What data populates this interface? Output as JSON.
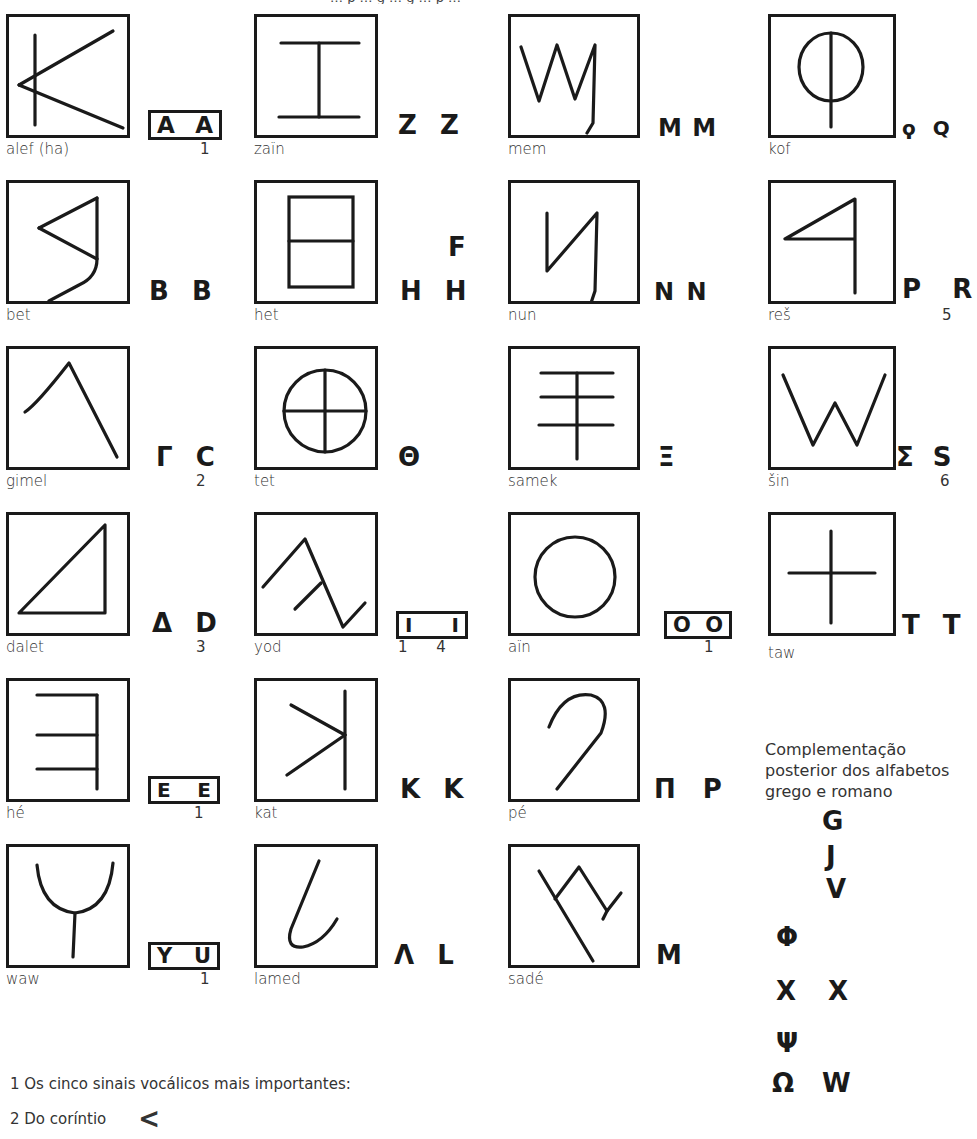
{
  "top_fragment": "… p … g … g … p …",
  "letters": [
    {
      "id": "alef",
      "name": "alef (ha)",
      "glyph": "alef-icon",
      "derivatives": [
        "A",
        "A"
      ],
      "vowel_box": true,
      "note": "1"
    },
    {
      "id": "bet",
      "name": "bet",
      "glyph": "bet-icon",
      "derivatives": [
        "B",
        "B"
      ],
      "vowel_box": false,
      "note": ""
    },
    {
      "id": "gimel",
      "name": "gimel",
      "glyph": "gimel-icon",
      "derivatives": [
        "Γ",
        "C"
      ],
      "vowel_box": false,
      "note": "2"
    },
    {
      "id": "dalet",
      "name": "dalet",
      "glyph": "dalet-icon",
      "derivatives": [
        "Δ",
        "D"
      ],
      "vowel_box": false,
      "note": "3"
    },
    {
      "id": "he",
      "name": "hé",
      "glyph": "he-icon",
      "derivatives": [
        "E",
        "E"
      ],
      "vowel_box": true,
      "note": "1"
    },
    {
      "id": "waw",
      "name": "waw",
      "glyph": "waw-icon",
      "derivatives": [
        "Y",
        "U"
      ],
      "vowel_box": true,
      "note": "1"
    },
    {
      "id": "zain",
      "name": "zaïn",
      "glyph": "zain-icon",
      "derivatives": [
        "Z",
        "Z"
      ],
      "vowel_box": false,
      "note": ""
    },
    {
      "id": "het",
      "name": "het",
      "glyph": "het-icon",
      "derivatives": [
        "H",
        "H"
      ],
      "extra": "F",
      "vowel_box": false,
      "note": ""
    },
    {
      "id": "tet",
      "name": "tet",
      "glyph": "tet-icon",
      "derivatives": [
        "Θ"
      ],
      "vowel_box": false,
      "note": ""
    },
    {
      "id": "yod",
      "name": "yod",
      "glyph": "yod-icon",
      "derivatives": [
        "I",
        "I"
      ],
      "vowel_box": true,
      "note": "1      4"
    },
    {
      "id": "kat",
      "name": "kat",
      "glyph": "kat-icon",
      "derivatives": [
        "K",
        "K"
      ],
      "vowel_box": false,
      "note": ""
    },
    {
      "id": "lamed",
      "name": "lamed",
      "glyph": "lamed-icon",
      "derivatives": [
        "Λ",
        "L"
      ],
      "vowel_box": false,
      "note": ""
    },
    {
      "id": "mem",
      "name": "mem",
      "glyph": "mem-icon",
      "derivatives": [
        "M",
        "M"
      ],
      "vowel_box": false,
      "note": ""
    },
    {
      "id": "nun",
      "name": "nun",
      "glyph": "nun-icon",
      "derivatives": [
        "N",
        "N"
      ],
      "vowel_box": false,
      "note": ""
    },
    {
      "id": "samek",
      "name": "samek",
      "glyph": "samek-icon",
      "derivatives": [
        "Ξ"
      ],
      "vowel_box": false,
      "note": ""
    },
    {
      "id": "ain",
      "name": "aïn",
      "glyph": "ain-icon",
      "derivatives": [
        "O",
        "O"
      ],
      "vowel_box": true,
      "note": "1"
    },
    {
      "id": "pe",
      "name": "pé",
      "glyph": "pe-icon",
      "derivatives": [
        "Π",
        "P"
      ],
      "vowel_box": false,
      "note": ""
    },
    {
      "id": "sade",
      "name": "sadé",
      "glyph": "sade-icon",
      "derivatives": [
        "M"
      ],
      "vowel_box": false,
      "note": ""
    },
    {
      "id": "kof",
      "name": "kof",
      "glyph": "kof-icon",
      "derivatives": [
        "ϙ",
        "Q"
      ],
      "vowel_box": false,
      "note": ""
    },
    {
      "id": "res",
      "name": "reš",
      "glyph": "res-icon",
      "derivatives": [
        "P",
        "R"
      ],
      "vowel_box": false,
      "note": "5"
    },
    {
      "id": "sin",
      "name": "šin",
      "glyph": "sin-icon",
      "derivatives": [
        "Σ",
        "S"
      ],
      "vowel_box": false,
      "note": "6"
    },
    {
      "id": "taw",
      "name": "taw",
      "glyph": "taw-icon",
      "derivatives": [
        "T",
        "T"
      ],
      "vowel_box": false,
      "note": ""
    }
  ],
  "complement": {
    "title": "Complementação posterior dos alfabetos grego e romano",
    "rows": [
      {
        "greek": "",
        "latin": "G"
      },
      {
        "greek": "",
        "latin": "J"
      },
      {
        "greek": "",
        "latin": "V"
      },
      {
        "greek": "Φ",
        "latin": ""
      },
      {
        "greek": "X",
        "latin": "X"
      },
      {
        "greek": "Ψ",
        "latin": ""
      },
      {
        "greek": "Ω",
        "latin": "W"
      }
    ]
  },
  "footnotes": [
    {
      "text": "1 Os cinco sinais vocálicos mais importantes:"
    },
    {
      "text": "2 Do coríntio",
      "glyph": "<"
    }
  ]
}
